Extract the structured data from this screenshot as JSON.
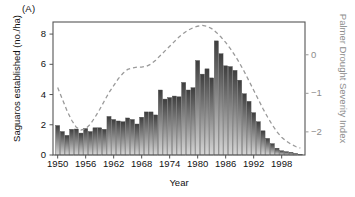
{
  "figure": {
    "panel_label": "(A)",
    "xlabel": "Year",
    "ylabel_left": "Saguaros established (no./ha)",
    "ylabel_right": "Palmer Drought Severity Index",
    "accent_bar_dark": "#3d3d3d",
    "accent_bar_light": "#d8d8d8",
    "accent_line": "#9a9a9a",
    "axis_color": "#555555"
  },
  "chart_data": {
    "type": "bar",
    "title": "",
    "xlabel": "Year",
    "ylabel": "Saguaros established (no./ha)",
    "ylabel_secondary": "Palmer Drought Severity Index",
    "grid": false,
    "legend": "none",
    "xlim": [
      1949,
      2003
    ],
    "ylim": [
      0,
      8.8
    ],
    "ylim_secondary": [
      -2.6,
      0.85
    ],
    "xticks": [
      1950,
      1956,
      1962,
      1968,
      1974,
      1980,
      1986,
      1992,
      1998
    ],
    "yticks": [
      0,
      2,
      4,
      6,
      8
    ],
    "yticks_secondary": [
      0,
      -1,
      -2
    ],
    "yticklabels_secondary": [
      "0",
      "−1",
      "−2"
    ],
    "categories": [
      1950,
      1951,
      1952,
      1953,
      1954,
      1955,
      1956,
      1957,
      1958,
      1959,
      1960,
      1961,
      1962,
      1963,
      1964,
      1965,
      1966,
      1967,
      1968,
      1969,
      1970,
      1971,
      1972,
      1973,
      1974,
      1975,
      1976,
      1977,
      1978,
      1979,
      1980,
      1981,
      1982,
      1983,
      1984,
      1985,
      1986,
      1987,
      1988,
      1989,
      1990,
      1991,
      1992,
      1993,
      1994,
      1995,
      1996,
      1997,
      1998,
      1999,
      2000,
      2001,
      2002
    ],
    "values": [
      1.95,
      1.55,
      1.3,
      1.7,
      1.72,
      1.45,
      1.75,
      1.55,
      1.8,
      1.8,
      1.7,
      2.55,
      2.35,
      2.25,
      2.2,
      2.45,
      2.35,
      2.05,
      2.5,
      2.85,
      2.85,
      2.65,
      4.3,
      3.7,
      3.8,
      3.9,
      3.85,
      4.8,
      4.3,
      4.45,
      6.25,
      5.35,
      5.7,
      5.1,
      7.55,
      6.7,
      5.9,
      5.85,
      5.6,
      4.95,
      4.05,
      3.55,
      2.8,
      2.2,
      1.6,
      1.1,
      0.75,
      0.45,
      0.28,
      0.22,
      0.18,
      0.1,
      0.05
    ],
    "series": [
      {
        "name": "Palmer Drought Severity Index",
        "type": "line",
        "style": "dashed",
        "axis": "secondary",
        "x": [
          1950,
          1951,
          1952,
          1953,
          1954,
          1955,
          1956,
          1957,
          1958,
          1959,
          1960,
          1961,
          1962,
          1963,
          1964,
          1965,
          1966,
          1967,
          1968,
          1969,
          1970,
          1971,
          1972,
          1973,
          1974,
          1975,
          1976,
          1977,
          1978,
          1979,
          1980,
          1981,
          1982,
          1983,
          1984,
          1985,
          1986,
          1987,
          1988,
          1989,
          1990,
          1991,
          1992,
          1993,
          1994,
          1995,
          1996,
          1997,
          1998,
          1999,
          2000,
          2001,
          2002
        ],
        "values": [
          -0.85,
          -1.15,
          -1.45,
          -1.7,
          -1.88,
          -1.95,
          -1.92,
          -1.8,
          -1.62,
          -1.42,
          -1.2,
          -0.98,
          -0.8,
          -0.62,
          -0.48,
          -0.38,
          -0.34,
          -0.32,
          -0.32,
          -0.3,
          -0.24,
          -0.14,
          -0.02,
          0.1,
          0.22,
          0.34,
          0.46,
          0.56,
          0.64,
          0.7,
          0.74,
          0.76,
          0.74,
          0.68,
          0.58,
          0.46,
          0.32,
          0.16,
          -0.02,
          -0.22,
          -0.44,
          -0.68,
          -0.92,
          -1.16,
          -1.4,
          -1.62,
          -1.82,
          -2.0,
          -2.14,
          -2.24,
          -2.32,
          -2.38,
          -2.42
        ]
      }
    ]
  }
}
